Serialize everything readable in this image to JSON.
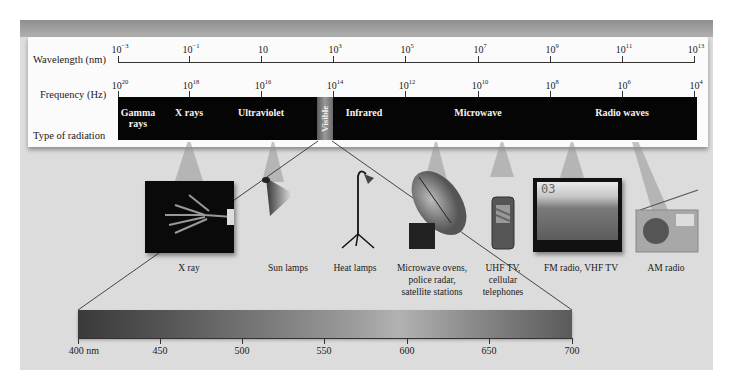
{
  "diagram": {
    "rows": {
      "wavelength_label": "Wavelength (nm)",
      "frequency_label": "Frequency (Hz)",
      "type_label": "Type of radiation"
    },
    "wavelength_ticks": [
      {
        "base": "10",
        "exp": "−3"
      },
      {
        "base": "10",
        "exp": "−1"
      },
      {
        "base": "10",
        "exp": ""
      },
      {
        "base": "10",
        "exp": "3"
      },
      {
        "base": "10",
        "exp": "5"
      },
      {
        "base": "10",
        "exp": "7"
      },
      {
        "base": "10",
        "exp": "9"
      },
      {
        "base": "10",
        "exp": "11"
      },
      {
        "base": "10",
        "exp": "13"
      }
    ],
    "frequency_ticks": [
      {
        "base": "10",
        "exp": "20"
      },
      {
        "base": "10",
        "exp": "18"
      },
      {
        "base": "10",
        "exp": "16"
      },
      {
        "base": "10",
        "exp": "14"
      },
      {
        "base": "10",
        "exp": "12"
      },
      {
        "base": "10",
        "exp": "10"
      },
      {
        "base": "10",
        "exp": "8"
      },
      {
        "base": "10",
        "exp": "6"
      },
      {
        "base": "10",
        "exp": "4"
      }
    ],
    "radiation_types": [
      {
        "label": "Gamma rays",
        "line1": "Gamma",
        "line2": "rays"
      },
      {
        "label": "X rays",
        "line1": "X rays",
        "line2": ""
      },
      {
        "label": "Ultraviolet",
        "line1": "Ultraviolet",
        "line2": ""
      },
      {
        "label": "Visible",
        "line1": "Visible",
        "line2": ""
      },
      {
        "label": "Infrared",
        "line1": "Infrared",
        "line2": ""
      },
      {
        "label": "Microwave",
        "line1": "Microwave",
        "line2": ""
      },
      {
        "label": "Radio waves",
        "line1": "Radio waves",
        "line2": ""
      }
    ],
    "applications": [
      {
        "icon": "x-ray-hand-image",
        "line1": "X ray",
        "line2": "",
        "line3": ""
      },
      {
        "icon": "sun-lamp-icon",
        "line1": "Sun lamps",
        "line2": "",
        "line3": ""
      },
      {
        "icon": "heat-lamp-icon",
        "line1": "Heat lamps",
        "line2": "",
        "line3": ""
      },
      {
        "icon": "satellite-dish-icon",
        "line1": "Microwave ovens,",
        "line2": "police radar,",
        "line3": "satellite stations"
      },
      {
        "icon": "cell-phone-icon",
        "line1": "UHF TV,",
        "line2": "cellular",
        "line3": "telephones"
      },
      {
        "icon": "television-icon",
        "line1": "FM radio, VHF TV",
        "line2": "",
        "line3": "",
        "tv_channel": "03"
      },
      {
        "icon": "am-radio-icon",
        "line1": "AM radio",
        "line2": "",
        "line3": ""
      }
    ],
    "visible_spectrum": {
      "ticks": [
        "400 nm",
        "450",
        "500",
        "550",
        "600",
        "650",
        "700"
      ]
    }
  }
}
